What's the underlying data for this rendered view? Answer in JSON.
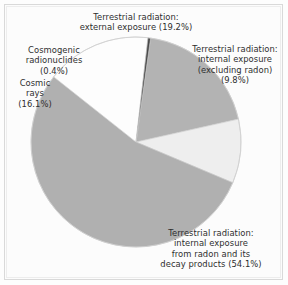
{
  "figure": {
    "background_color": "#fdfdfd",
    "frame_color": "#d9d9d9",
    "text_color": "#2e2e2e"
  },
  "chart_data": {
    "type": "pie",
    "title": "",
    "subtitle": "",
    "xlabel": "",
    "ylabel": "",
    "legend_position": "none",
    "grid": false,
    "units": "percent",
    "total": 99.6,
    "start_angle_deg": -82,
    "direction": "clockwise",
    "center": {
      "x": 136,
      "y": 142
    },
    "radius": 105,
    "categories": [
      "Terrestrial radiation: external exposure",
      "Terrestrial radiation: internal exposure (excluding radon)",
      "Terrestrial radiation: internal exposure from radon and its decay products",
      "Cosmic rays",
      "Cosmogenic radionuclides"
    ],
    "values": [
      19.2,
      9.8,
      54.1,
      16.1,
      0.4
    ],
    "colors": [
      "#b3b3b3",
      "#eeeeee",
      "#b0b0b0",
      "#fdfdfd",
      "#4a4a4a"
    ],
    "slices": [
      {
        "label": "Terrestrial radiation: external exposure",
        "value": 19.2,
        "value_text": "19.2%",
        "color": "#b3b3b3"
      },
      {
        "label": "Terrestrial radiation: internal exposure (excluding radon)",
        "value": 9.8,
        "value_text": "9.8%",
        "color": "#eeeeee"
      },
      {
        "label": "Terrestrial radiation: internal exposure from radon and its decay products",
        "value": 54.1,
        "value_text": "54.1%",
        "color": "#b0b0b0"
      },
      {
        "label": "Cosmic rays",
        "value": 16.1,
        "value_text": "16.1%",
        "color": "#fdfdfd"
      },
      {
        "label": "Cosmogenic radionuclides",
        "value": 0.4,
        "value_text": "0.4%",
        "color": "#4a4a4a"
      }
    ]
  },
  "labels": {
    "external": "Terrestrial radiation:\nexternal exposure (19.2%)",
    "internal_excluding_radon": "Terrestrial radiation:\ninternal exposure\n(excluding radon)\n(9.8%)",
    "cosmogenic": "Cosmogenic\nradionuclides\n(0.4%)",
    "cosmic_rays": "Cosmic\nrays\n(16.1%)",
    "radon": "Terrestrial radiation:\ninternal exposure\nfrom radon and its\ndecay products (54.1%)"
  }
}
